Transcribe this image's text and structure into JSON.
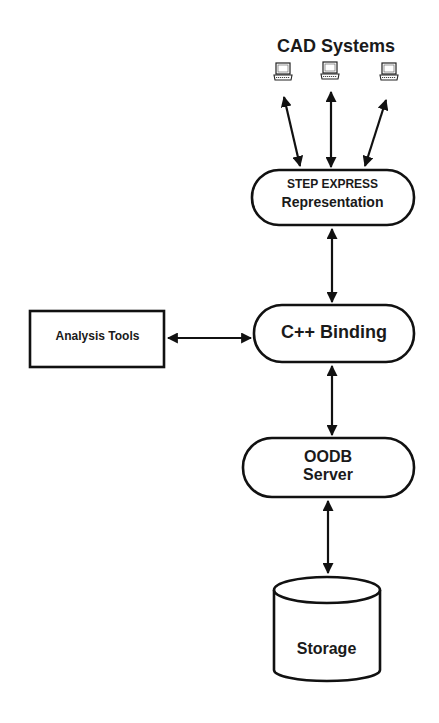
{
  "diagram": {
    "type": "architecture-flow",
    "nodes": {
      "cad_systems": {
        "label": "CAD Systems",
        "icon": "laptop-icon",
        "count": 3
      },
      "step_express": {
        "line1": "STEP EXPRESS",
        "line2": "Representation"
      },
      "cpp_binding": {
        "label": "C++ Binding"
      },
      "analysis_tools": {
        "label": "Analysis Tools"
      },
      "oodb_server": {
        "line1": "OODB",
        "line2": "Server"
      },
      "storage": {
        "label": "Storage"
      }
    },
    "edges": [
      {
        "from": "CAD Systems (laptop 1)",
        "to": "STEP EXPRESS Representation",
        "direction": "bidirectional"
      },
      {
        "from": "CAD Systems (laptop 2)",
        "to": "STEP EXPRESS Representation",
        "direction": "bidirectional"
      },
      {
        "from": "CAD Systems (laptop 3)",
        "to": "STEP EXPRESS Representation",
        "direction": "bidirectional"
      },
      {
        "from": "STEP EXPRESS Representation",
        "to": "C++ Binding",
        "direction": "bidirectional"
      },
      {
        "from": "Analysis Tools",
        "to": "C++ Binding",
        "direction": "bidirectional"
      },
      {
        "from": "C++ Binding",
        "to": "OODB Server",
        "direction": "bidirectional"
      },
      {
        "from": "OODB Server",
        "to": "Storage",
        "direction": "bidirectional"
      }
    ],
    "colors": {
      "stroke": "#111111",
      "fill": "#ffffff",
      "text": "#1a1a1a"
    }
  }
}
